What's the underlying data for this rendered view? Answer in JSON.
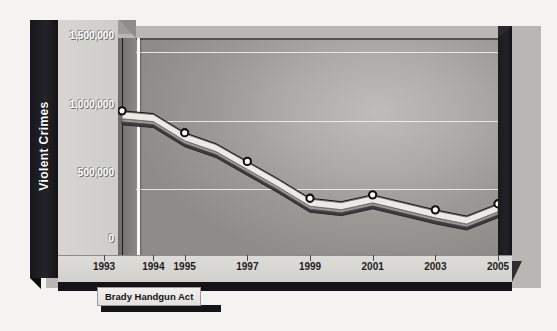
{
  "chart_data": {
    "type": "line",
    "title": "",
    "xlabel": "",
    "ylabel": "Violent Crimes",
    "ylim": [
      0,
      1600000
    ],
    "yticks": [
      0,
      500000,
      1000000,
      1500000
    ],
    "ytick_labels": [
      "0",
      "500,000",
      "1,000,000",
      "1,500,000"
    ],
    "xtick_labels": [
      "1993",
      "1994",
      "1995",
      "1997",
      "1999",
      "2001",
      "2003",
      "2005"
    ],
    "grid": true,
    "legend": "none",
    "x": [
      1993,
      1994,
      1995,
      1996,
      1997,
      1998,
      1999,
      2000,
      2001,
      2002,
      2003,
      2004,
      2005
    ],
    "categories": [
      "1993",
      "1994",
      "1995",
      "1996",
      "1997",
      "1998",
      "1999",
      "2000",
      "2001",
      "2002",
      "2003",
      "2004",
      "2005"
    ],
    "series": [
      {
        "name": "Violent Crimes",
        "values": [
          1070000,
          1050000,
          910000,
          830000,
          700000,
          570000,
          430000,
          405000,
          455000,
          400000,
          345000,
          300000,
          390000
        ]
      }
    ],
    "markers_at": [
      "1993",
      "1995",
      "1997",
      "1999",
      "2001",
      "2003",
      "2005"
    ],
    "annotations": [
      {
        "label": "Brady Handgun Act",
        "at_x": "1994",
        "style": "vertical-line-with-callout"
      }
    ]
  },
  "axis": {
    "y_title": "Violent Crimes",
    "y_labels": [
      {
        "text": "1,500,000",
        "value": 1500000
      },
      {
        "text": "1,000,000",
        "value": 1000000
      },
      {
        "text": "500,000",
        "value": 500000
      },
      {
        "text": "0",
        "value": 0
      }
    ],
    "x_labels": [
      {
        "text": "1993",
        "value": 1993
      },
      {
        "text": "1994",
        "value": 1994
      },
      {
        "text": "1995",
        "value": 1995
      },
      {
        "text": "1997",
        "value": 1997
      },
      {
        "text": "1999",
        "value": 1999
      },
      {
        "text": "2001",
        "value": 2001
      },
      {
        "text": "2003",
        "value": 2003
      },
      {
        "text": "2005",
        "value": 2005
      }
    ]
  },
  "annotation": {
    "brady_label": "Brady Handgun Act"
  },
  "colors": {
    "axis_title_bar": "#17161a",
    "label_panel": "#d8d6d3",
    "plot_fill": "#a8a6a3",
    "gridline": "#efeeec",
    "line_top": "#f0efec",
    "line_shadow": "#3b3a3e",
    "marker_fill": "#ffffff",
    "marker_stroke": "#111015",
    "brady_line": "#f7f6f4",
    "page_bg": "#f4f3f1"
  }
}
